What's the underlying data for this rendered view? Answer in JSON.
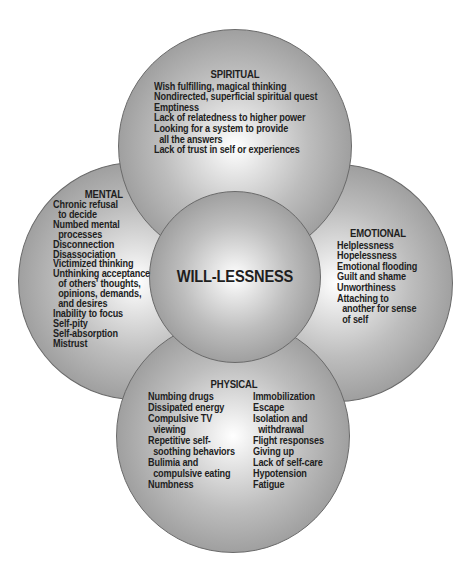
{
  "diagram": {
    "center": {
      "label": "WILL-LESSNESS"
    },
    "spiritual": {
      "title": "SPIRITUAL",
      "items": [
        "Wish fulfilling, magical thinking",
        "Nondirected, superficial spiritual quest",
        "Emptiness",
        "Lack of relatedness to higher power",
        "Looking for a system to provide",
        "all the answers",
        "Lack of trust in self or experiences"
      ]
    },
    "mental": {
      "title": "MENTAL",
      "items": [
        "Chronic refusal",
        "to decide",
        "Numbed mental",
        "processes",
        "Disconnection",
        "Disassociation",
        "Victimized thinking",
        "Unthinking acceptance",
        "of others' thoughts,",
        "opinions, demands,",
        "and desires",
        "Inability to focus",
        "Self-pity",
        "Self-absorption",
        "Mistrust"
      ]
    },
    "emotional": {
      "title": "EMOTIONAL",
      "items": [
        "Helplessness",
        "Hopelessness",
        "Emotional flooding",
        "Guilt and shame",
        "Unworthiness",
        "Attaching to",
        "another for sense",
        "of self"
      ]
    },
    "physical": {
      "title": "PHYSICAL",
      "left_items": [
        "Numbing drugs",
        "Dissipated energy",
        "Compulsive TV",
        "viewing",
        "Repetitive self-",
        "soothing behaviors",
        "Bulimia and",
        "compulsive eating",
        "Numbness"
      ],
      "right_items": [
        "Immobilization",
        "Escape",
        "Isolation and",
        "withdrawal",
        "Flight responses",
        "Giving up",
        "Lack of self-care",
        "Hypotension",
        "Fatigue"
      ]
    }
  }
}
